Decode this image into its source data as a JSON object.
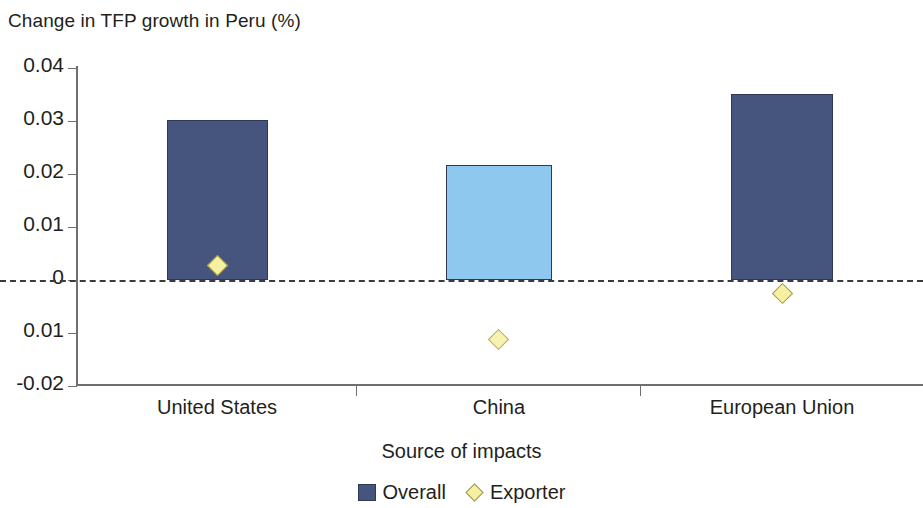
{
  "chart_data": {
    "type": "bar",
    "title": "Change in TFP growth in Peru (%)",
    "xlabel": "Source of impacts",
    "ylabel": "",
    "categories": [
      "United States",
      "China",
      "European Union"
    ],
    "ylim": [
      -0.02,
      0.04
    ],
    "ytick_labels": [
      "0.04",
      "0.03",
      "0.02",
      "0.01",
      "0",
      "0.01",
      "-0.02"
    ],
    "ytick_values": [
      0.04,
      0.03,
      0.02,
      0.01,
      0,
      -0.01,
      -0.02
    ],
    "grid": false,
    "zero_line": true,
    "legend_position": "bottom-center",
    "series": [
      {
        "name": "Overall",
        "type": "bar",
        "values": [
          0.0302,
          0.0217,
          0.0351
        ],
        "colors": [
          "#46557e",
          "#8ec8ef",
          "#46557e"
        ]
      },
      {
        "name": "Exporter",
        "type": "scatter",
        "marker": "diamond",
        "values": [
          0.0028,
          -0.0113,
          -0.0025
        ],
        "color": "#f7f0a0"
      }
    ]
  },
  "chart": {
    "title": "Change in TFP growth in Peru (%)",
    "x_axis_title": "Source of impacts",
    "y_ticks": [
      {
        "label": "0.04",
        "value": 0.04
      },
      {
        "label": "0.03",
        "value": 0.03
      },
      {
        "label": "0.02",
        "value": 0.02
      },
      {
        "label": "0.01",
        "value": 0.01
      },
      {
        "label": "0",
        "value": 0
      },
      {
        "label": "0.01",
        "value": -0.01
      },
      {
        "label": "-0.02",
        "value": -0.02
      }
    ],
    "x_categories": [
      {
        "label": "United States"
      },
      {
        "label": "China"
      },
      {
        "label": "European Union"
      }
    ],
    "legend": [
      {
        "label": "Overall",
        "marker": "square",
        "color": "#46557e"
      },
      {
        "label": "Exporter",
        "marker": "diamond",
        "color": "#f7f0a0"
      }
    ]
  }
}
